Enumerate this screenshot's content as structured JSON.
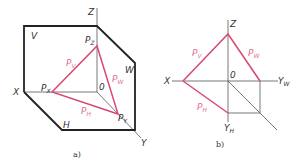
{
  "figure_a": {
    "caption": "a)",
    "axes": {
      "x": "X",
      "y": "Y",
      "z": "Z",
      "origin": "0"
    },
    "planes": {
      "v": "V",
      "h": "H",
      "w": "W"
    },
    "points": {
      "px": {
        "main": "P",
        "sub": "X"
      },
      "py": {
        "main": "P",
        "sub": "Y"
      },
      "pz": {
        "main": "P",
        "sub": "Z"
      }
    },
    "traces": {
      "pv": {
        "main": "P",
        "sub": "V"
      },
      "ph": {
        "main": "P",
        "sub": "H"
      },
      "pw": {
        "main": "P",
        "sub": "W"
      }
    }
  },
  "figure_b": {
    "caption": "b)",
    "axes": {
      "x": "X",
      "z": "Z",
      "yw": {
        "main": "Y",
        "sub": "W"
      },
      "yh": {
        "main": "Y",
        "sub": "H"
      },
      "origin": "0"
    },
    "traces": {
      "pv": {
        "main": "P",
        "sub": "V"
      },
      "pw": {
        "main": "P",
        "sub": "W"
      },
      "ph": {
        "main": "P",
        "sub": "H"
      }
    }
  },
  "colors": {
    "trace": "#d9486f",
    "frame": "#222222",
    "axis": "#555555",
    "trace_label": "#e0708f"
  }
}
